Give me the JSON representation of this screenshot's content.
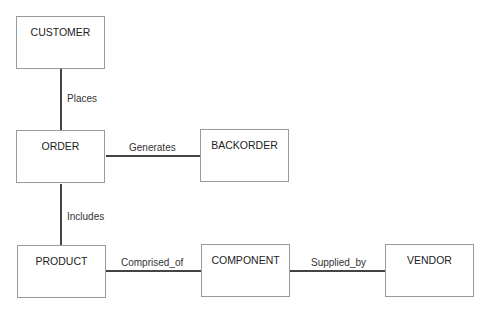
{
  "diagram": {
    "type": "entity-relationship",
    "entities": [
      {
        "id": "customer",
        "label": "CUSTOMER"
      },
      {
        "id": "order",
        "label": "ORDER"
      },
      {
        "id": "backorder",
        "label": "BACKORDER"
      },
      {
        "id": "product",
        "label": "PRODUCT"
      },
      {
        "id": "component",
        "label": "COMPONENT"
      },
      {
        "id": "vendor",
        "label": "VENDOR"
      }
    ],
    "relationships": [
      {
        "from": "customer",
        "to": "order",
        "label": "Places"
      },
      {
        "from": "order",
        "to": "backorder",
        "label": "Generates"
      },
      {
        "from": "order",
        "to": "product",
        "label": "Includes"
      },
      {
        "from": "product",
        "to": "component",
        "label": "Comprised_of"
      },
      {
        "from": "component",
        "to": "vendor",
        "label": "Supplied_by"
      }
    ]
  }
}
